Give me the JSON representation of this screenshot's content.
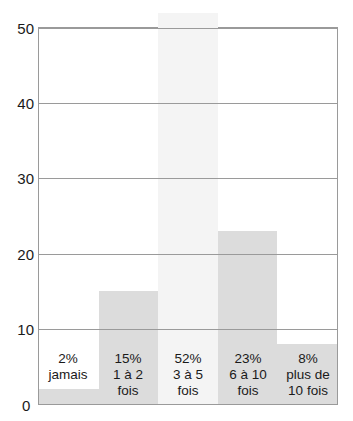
{
  "figure": {
    "cropped_header_text": "",
    "zero_label": "0"
  },
  "chart_data": {
    "type": "bar",
    "title": "",
    "subtitle": "",
    "xlabel": "",
    "ylabel": "",
    "ylim": [
      0,
      50
    ],
    "yticks": [
      10,
      20,
      30,
      40,
      50
    ],
    "ytick_labels": [
      "10",
      "20",
      "30",
      "40",
      "50"
    ],
    "grid": true,
    "grid_axis": "y",
    "legend": false,
    "categories": [
      "jamais",
      "1 à 2 fois",
      "3 à 5 fois",
      "6 à 10 fois",
      "plus de 10 fois"
    ],
    "values": [
      2,
      15,
      52,
      23,
      8
    ],
    "value_labels": [
      "2%",
      "15%",
      "52%",
      "23%",
      "8%"
    ],
    "units": "percent",
    "bars": [
      {
        "value": 2,
        "percent_label": "2%",
        "category_line1": "jamais",
        "category_line2": "",
        "color": "#dcdcdc"
      },
      {
        "value": 15,
        "percent_label": "15%",
        "category_line1": "1 à 2",
        "category_line2": "fois",
        "color": "#dcdcdc"
      },
      {
        "value": 52,
        "percent_label": "52%",
        "category_line1": "3 à 5",
        "category_line2": "fois",
        "color": "#f4f4f4"
      },
      {
        "value": 23,
        "percent_label": "23%",
        "category_line1": "6 à 10",
        "category_line2": "fois",
        "color": "#dcdcdc"
      },
      {
        "value": 8,
        "percent_label": "8%",
        "category_line1": "plus de",
        "category_line2": "10 fois",
        "color": "#dcdcdc"
      }
    ]
  }
}
